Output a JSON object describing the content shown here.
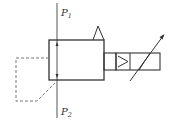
{
  "diagram": {
    "type": "hydraulic-valve-symbol",
    "labels": {
      "p1": {
        "main": "P",
        "sub": "1"
      },
      "p2": {
        "main": "P",
        "sub": "2"
      }
    },
    "colors": {
      "line": "#333333",
      "dashed": "#777777",
      "background": "#ffffff"
    }
  }
}
